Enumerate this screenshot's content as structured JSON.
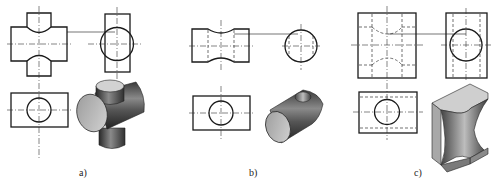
{
  "figure": {
    "panels": [
      {
        "id": "a",
        "label": "a)",
        "caption_pos": [
          84,
          174
        ]
      },
      {
        "id": "b",
        "label": "b)",
        "caption_pos": [
          254,
          174
        ]
      },
      {
        "id": "c",
        "label": "c)",
        "caption_pos": [
          419,
          174
        ]
      }
    ]
  },
  "colors": {
    "outline": "#1a1a1a",
    "centerline": "#333333",
    "hidden": "#333333",
    "background": "#ffffff",
    "shade_dark": "#2e2e2e",
    "shade_mid": "#7a7a7a",
    "shade_light": "#c8c8c8",
    "face_light": "#d6d6d6"
  }
}
